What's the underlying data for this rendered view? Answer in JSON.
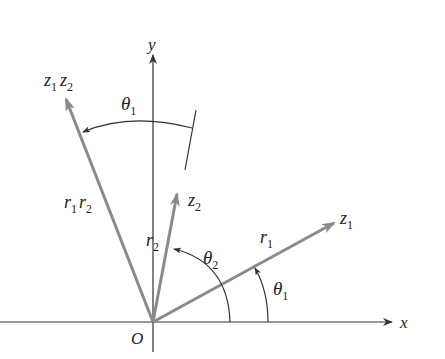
{
  "diagram": {
    "axes": {
      "x_label": "x",
      "y_label": "y",
      "origin_label": "O"
    },
    "vectors": [
      {
        "name": "z1",
        "label": "z",
        "label_sub": "1",
        "modulus_label": "r",
        "modulus_sub": "1",
        "color": "#8a8a8a"
      },
      {
        "name": "z2",
        "label": "z",
        "label_sub": "2",
        "modulus_label": "r",
        "modulus_sub": "2",
        "color": "#8a8a8a"
      },
      {
        "name": "z1z2",
        "label_a": "z",
        "label_a_sub": "1",
        "label_b": "z",
        "label_b_sub": "2",
        "modulus_a": "r",
        "modulus_a_sub": "1",
        "modulus_b": "r",
        "modulus_b_sub": "2",
        "color": "#8a8a8a"
      }
    ],
    "angles": [
      {
        "name": "theta1-from-x",
        "label": "θ",
        "sub": "1"
      },
      {
        "name": "theta2-from-x",
        "label": "θ",
        "sub": "2"
      },
      {
        "name": "theta1-rotation",
        "label": "θ",
        "sub": "1"
      }
    ],
    "colors": {
      "axis": "#333333",
      "vector": "#8a8a8a",
      "arc": "#333333"
    }
  }
}
